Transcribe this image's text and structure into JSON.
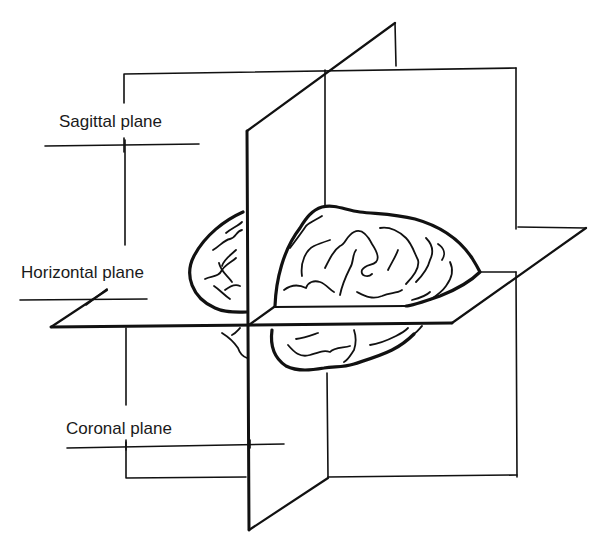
{
  "diagram": {
    "type": "anatomical-planes-brain",
    "labels": {
      "sagittal": "Sagittal plane",
      "horizontal": "Horizontal plane",
      "coronal": "Coronal plane"
    },
    "colors": {
      "line": "#111111",
      "text": "#1a1a1a",
      "background": "#ffffff"
    }
  }
}
